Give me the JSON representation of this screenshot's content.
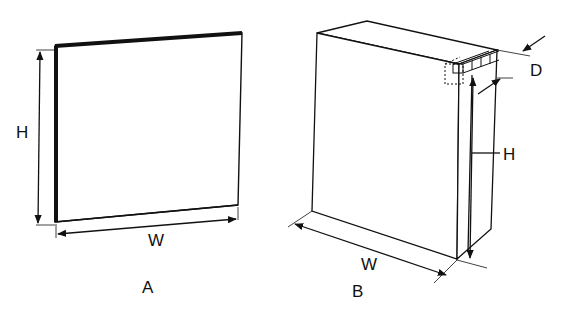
{
  "figure_a": {
    "caption": "A",
    "height_label": "H",
    "width_label": "W"
  },
  "figure_b": {
    "caption": "B",
    "height_label": "H",
    "width_label": "W",
    "depth_label": "D"
  },
  "colors": {
    "line": "#111111",
    "background": "#ffffff"
  }
}
